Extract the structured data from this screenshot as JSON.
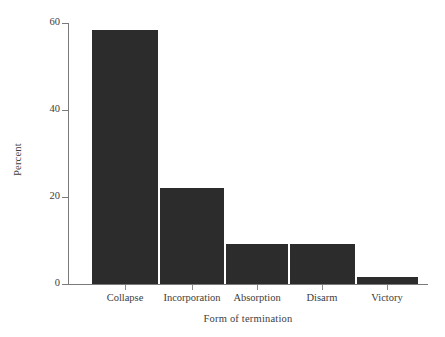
{
  "chart_data": {
    "type": "bar",
    "title": "",
    "subtitle": "",
    "xlabel": "Form of termination",
    "ylabel": "Percent",
    "categories": [
      "Collapse",
      "Incorporation",
      "Absorption",
      "Disarm",
      "Victory"
    ],
    "values": [
      58.4,
      22.1,
      9.2,
      9.2,
      1.6
    ],
    "series": [
      {
        "name": "Percent",
        "values": [
          58.4,
          22.1,
          9.2,
          9.2,
          1.6
        ]
      }
    ],
    "ylim": [
      0,
      60
    ],
    "xlim": null,
    "yticks": [
      0,
      20,
      40,
      60
    ],
    "ytick_labels": [
      "0",
      "20",
      "40",
      "60"
    ],
    "grid": false,
    "legend": false,
    "legend_position": "none",
    "bar_color": "#2c2c2c",
    "axis_color": "#7a7a7a",
    "text_color": "#3d3d3d",
    "background": "#ffffff",
    "annotations": []
  },
  "axes": {
    "y_title": "Percent",
    "x_title": "Form of termination"
  }
}
